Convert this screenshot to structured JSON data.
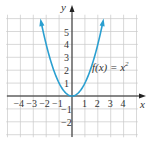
{
  "chart_data": {
    "type": "line",
    "title": "",
    "function_label": "f(x) = x",
    "function_exponent": "2",
    "xlabel": "x",
    "ylabel": "y",
    "xlim": [
      -5,
      5
    ],
    "ylim": [
      -3,
      6
    ],
    "grid": true,
    "x_ticks": [
      "-4",
      "-3",
      "-2",
      "-1",
      "1",
      "2",
      "3",
      "4"
    ],
    "y_ticks": [
      "5",
      "4",
      "3",
      "2",
      "1",
      "-1",
      "-2"
    ],
    "series": [
      {
        "name": "f(x) = x^2",
        "color": "#2a9fd0",
        "x": [
          -2.4,
          -2,
          -1.5,
          -1,
          -0.5,
          0,
          0.5,
          1,
          1.5,
          2,
          2.4
        ],
        "y": [
          5.76,
          4,
          2.25,
          1,
          0.25,
          0,
          0.25,
          1,
          2.25,
          4,
          5.76
        ]
      }
    ]
  }
}
